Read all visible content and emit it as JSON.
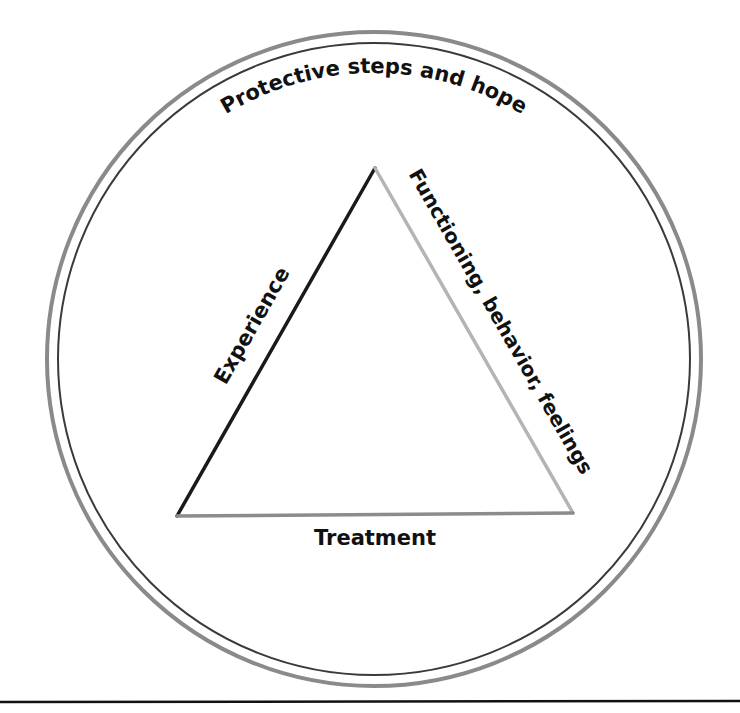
{
  "diagram": {
    "outer_circle": {
      "label": "Protective steps and hope",
      "cx": 374,
      "cy": 359,
      "outer_ring_radius": 327,
      "inner_ring_radius": 316,
      "outer_ring_color": "#8a8a8a",
      "inner_ring_color": "#3a3a3a"
    },
    "triangle": {
      "apex": [
        375,
        168
      ],
      "bottom_left": [
        177,
        516
      ],
      "bottom_right": [
        573,
        513
      ],
      "sides": [
        {
          "id": "left",
          "label": "Experience",
          "color": "#1a1a1a"
        },
        {
          "id": "right",
          "label": "Functioning, behavior, feelings",
          "color": "#b4b4b4"
        },
        {
          "id": "bottom",
          "label": "Treatment",
          "color": "#8c8c8c"
        }
      ]
    },
    "footer_rule_color": "#111111"
  }
}
